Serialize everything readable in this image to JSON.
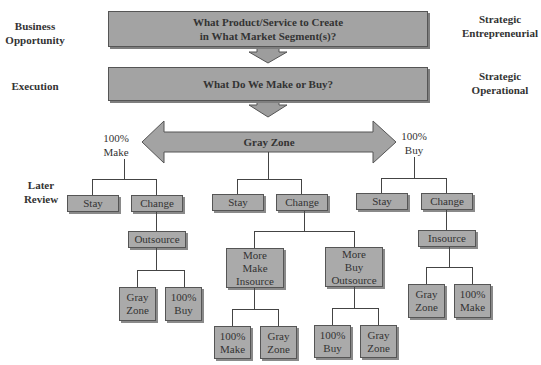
{
  "left_labels": {
    "business_opportunity": [
      "Business",
      "Opportunity"
    ],
    "execution": "Execution",
    "later_review": [
      "Later",
      "Review"
    ]
  },
  "right_labels": {
    "strategic_entrepreneurial": [
      "Strategic",
      "Entrepreneurial"
    ],
    "strategic_operational": [
      "Strategic",
      "Operational"
    ]
  },
  "top_box": {
    "line1": "What Product/Service to Create",
    "line2": "in What Market Segment(s)?"
  },
  "middle_box": {
    "text": "What Do We Make or Buy?"
  },
  "gray_zone_arrow": {
    "text": "Gray Zone",
    "left_end": [
      "100%",
      "Make"
    ],
    "right_end": [
      "100%",
      "Buy"
    ]
  },
  "colors": {
    "box_fill": "#a8a8a8",
    "border": "#555555",
    "line": "#444444",
    "background": "#ffffff"
  },
  "trees": {
    "make": {
      "stay": "Stay",
      "change": "Change",
      "action": "Outsource",
      "outcomes": [
        [
          "Gray",
          "Zone"
        ],
        [
          "100%",
          "Buy"
        ]
      ]
    },
    "gray": {
      "stay": "Stay",
      "change": "Change",
      "branches": [
        {
          "label": [
            "More",
            "Make",
            "Insource"
          ],
          "outcomes": [
            [
              "100%",
              "Make"
            ],
            [
              "Gray",
              "Zone"
            ]
          ]
        },
        {
          "label": [
            "More",
            "Buy",
            "Outsource"
          ],
          "outcomes": [
            [
              "100%",
              "Buy"
            ],
            [
              "Gray",
              "Zone"
            ]
          ]
        }
      ]
    },
    "buy": {
      "stay": "Stay",
      "change": "Change",
      "action": "Insource",
      "outcomes": [
        [
          "Gray",
          "Zone"
        ],
        [
          "100%",
          "Make"
        ]
      ]
    }
  }
}
